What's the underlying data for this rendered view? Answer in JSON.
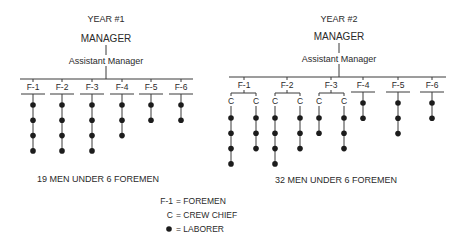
{
  "year1": {
    "title": "YEAR #1",
    "manager": "MANAGER",
    "assistant": "Assistant Manager",
    "caption": "19 MEN UNDER 6 FOREMEN",
    "foremen": [
      {
        "label": "F-1",
        "crews": [
          {
            "chief": false,
            "laborers": 4
          }
        ]
      },
      {
        "label": "F-2",
        "crews": [
          {
            "chief": false,
            "laborers": 4
          }
        ]
      },
      {
        "label": "F-3",
        "crews": [
          {
            "chief": false,
            "laborers": 4
          }
        ]
      },
      {
        "label": "F-4",
        "crews": [
          {
            "chief": false,
            "laborers": 3
          }
        ]
      },
      {
        "label": "F-5",
        "crews": [
          {
            "chief": false,
            "laborers": 2
          }
        ]
      },
      {
        "label": "F-6",
        "crews": [
          {
            "chief": false,
            "laborers": 2
          }
        ]
      }
    ]
  },
  "year2": {
    "title": "YEAR #2",
    "manager": "MANAGER",
    "assistant": "Assistant Manager",
    "caption": "32 MEN UNDER 6 FOREMEN",
    "chief_symbol": "C",
    "foremen": [
      {
        "label": "F-1",
        "crews": [
          {
            "chief": true,
            "laborers": 4
          },
          {
            "chief": true,
            "laborers": 3
          }
        ]
      },
      {
        "label": "F-2",
        "crews": [
          {
            "chief": true,
            "laborers": 4
          },
          {
            "chief": true,
            "laborers": 3
          }
        ]
      },
      {
        "label": "F-3",
        "crews": [
          {
            "chief": true,
            "laborers": 2
          },
          {
            "chief": true,
            "laborers": 3
          }
        ]
      },
      {
        "label": "F-4",
        "crews": [
          {
            "chief": false,
            "laborers": 2
          }
        ]
      },
      {
        "label": "F-5",
        "crews": [
          {
            "chief": false,
            "laborers": 3
          }
        ]
      },
      {
        "label": "F-6",
        "crews": [
          {
            "chief": false,
            "laborers": 2
          }
        ]
      }
    ]
  },
  "legend": {
    "items": [
      {
        "symbol": "F-1",
        "text": "= FOREMEN"
      },
      {
        "symbol": "C",
        "text": "= CREW CHIEF"
      },
      {
        "symbol": "dot",
        "text": "= LABORER"
      }
    ]
  }
}
